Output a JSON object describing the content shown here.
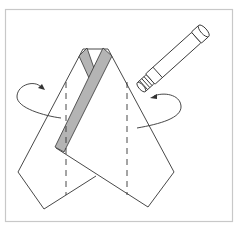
{
  "diagram": {
    "description": "Paper folding instruction step: apply glue to the center strip, then fold both side flaps inward along the dashed lines",
    "colors": {
      "background": "#ffffff",
      "frame": "#c8c8c8",
      "line": "#333333",
      "strip_fill": "#b4b4b4",
      "glue_stick_fill": "#ffffff"
    },
    "elements": {
      "frame": "frame-border",
      "paper": "folded-paper-shape",
      "strip": "gray-crossed-strip",
      "fold_lines": [
        "left-dashed-fold-line",
        "right-dashed-fold-line"
      ],
      "arrows": [
        "left-fold-arrow",
        "right-fold-arrow"
      ],
      "tool": "glue-stick-icon"
    }
  }
}
